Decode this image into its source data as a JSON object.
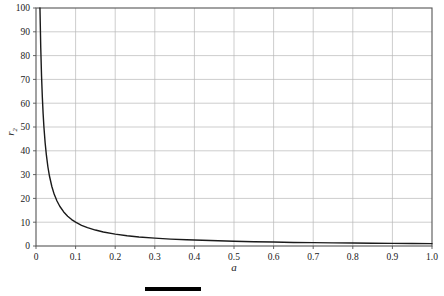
{
  "chart_data": {
    "type": "line",
    "title": "",
    "subtitle": "",
    "xlabel": "a",
    "ylabel": "r",
    "ylabel_subscript": "2",
    "xlim": [
      0,
      1.0
    ],
    "ylim": [
      0,
      100
    ],
    "grid": true,
    "legend": null,
    "legend_position": "none",
    "x_ticks": [
      "0",
      "0.1",
      "0.2",
      "0.3",
      "0.4",
      "0.5",
      "0.6",
      "0.7",
      "0.8",
      "0.9",
      "1.0"
    ],
    "x_tick_values": [
      0,
      0.1,
      0.2,
      0.3,
      0.4,
      0.5,
      0.6,
      0.7,
      0.8,
      0.9,
      1.0
    ],
    "y_ticks": [
      "0",
      "10",
      "20",
      "30",
      "40",
      "50",
      "60",
      "70",
      "80",
      "90",
      "100"
    ],
    "y_tick_values": [
      0,
      10,
      20,
      30,
      40,
      50,
      60,
      70,
      80,
      90,
      100
    ],
    "series": [
      {
        "name": "r2 = 1/a",
        "color": "#1a1a1a",
        "line_width": 1.4,
        "x": [
          0.01,
          0.012,
          0.014,
          0.016,
          0.018,
          0.02,
          0.023,
          0.026,
          0.03,
          0.034,
          0.04,
          0.046,
          0.053,
          0.06,
          0.07,
          0.08,
          0.09,
          0.1,
          0.115,
          0.13,
          0.15,
          0.17,
          0.2,
          0.23,
          0.26,
          0.3,
          0.34,
          0.38,
          0.42,
          0.46,
          0.5,
          0.55,
          0.6,
          0.65,
          0.7,
          0.75,
          0.8,
          0.85,
          0.9,
          0.95,
          1.0
        ],
        "y": [
          100.0,
          83.3,
          71.4,
          62.5,
          55.6,
          50.0,
          43.5,
          38.5,
          33.3,
          29.4,
          25.0,
          21.7,
          18.9,
          16.7,
          14.3,
          12.5,
          11.1,
          10.0,
          8.7,
          7.7,
          6.7,
          5.9,
          5.0,
          4.3,
          3.8,
          3.3,
          2.9,
          2.6,
          2.4,
          2.2,
          2.0,
          1.8,
          1.7,
          1.5,
          1.4,
          1.3,
          1.25,
          1.18,
          1.11,
          1.05,
          1.0
        ]
      }
    ],
    "annotations": [],
    "footer_rule": {
      "present": true,
      "color": "#000000"
    }
  },
  "style": {
    "grid_color": "#b8b8b8",
    "axis_color": "#555555",
    "background": "#ffffff",
    "text_color": "#1a1a1a"
  }
}
